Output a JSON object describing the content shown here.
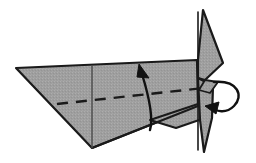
{
  "figure": {
    "step_label": "",
    "background_color": "#ffffff",
    "paper_fill": "#9e9e9e",
    "paper_fill_light": "#a8a8a8",
    "paper_fill_dark": "#8f8f8f",
    "outline_color": "#1a1a1a",
    "crease_color": "#1a1a1a",
    "arrow_color": "#111111"
  },
  "shapes": {
    "wing": {
      "name": "main-wing-panel",
      "fill": "#9e9e9e",
      "stroke": "#1a1a1a",
      "stroke_width": 2.2,
      "points": "16,68 197,60 198,106 92,148"
    },
    "wing_lower_flap": {
      "name": "lower-body-flap",
      "fill": "#9e9e9e",
      "stroke": "#1a1a1a",
      "stroke_width": 2.0,
      "points": "150,120 198,104 205,118 176,128"
    },
    "fin_upper": {
      "name": "vertical-fin-upper",
      "fill": "#9e9e9e",
      "stroke": "#1a1a1a",
      "stroke_width": 2.2,
      "points": "203,10 223,63 205,80 198,78 198,60"
    },
    "fin_lower": {
      "name": "vertical-fin-lower",
      "fill": "#9e9e9e",
      "stroke": "#1a1a1a",
      "stroke_width": 2.2,
      "points": "198,78 213,86 212,118 204,152 200,120"
    },
    "fin_notch": {
      "name": "fin-notch-wedge",
      "fill": "#9e9e9e",
      "stroke": "#1a1a1a",
      "stroke_width": 1.8,
      "points": "205,80 218,82 210,93 199,90"
    }
  },
  "creases": {
    "center_crease": {
      "name": "vertical-center-crease",
      "d": "M 92,66 L 92,148",
      "stroke": "#4a4a4a",
      "stroke_width": 1.4,
      "dash": ""
    },
    "valley_fold": {
      "name": "valley-fold-dashed-line",
      "d": "M 57,104 L 204,88",
      "stroke": "#1a1a1a",
      "stroke_width": 2.4,
      "dash": "11 8"
    },
    "fin_seam": {
      "name": "fin-seam-line",
      "d": "M 198,12 L 198,150",
      "stroke": "#1a1a1a",
      "stroke_width": 1.6,
      "dash": ""
    },
    "body_edge": {
      "name": "body-lower-edge",
      "d": "M 92,148 L 198,106",
      "stroke": "#1a1a1a",
      "stroke_width": 2.0,
      "dash": ""
    }
  },
  "arrows": {
    "fold_up": {
      "name": "fold-up-arrow",
      "label": "fold wing up",
      "path_d": "M 150,130 C 153,120 150,100 142,74",
      "head_points": "139,64 149,78 137,77",
      "stroke": "#111111",
      "stroke_width": 2.4
    },
    "fin_loop": {
      "name": "fin-fold-loop-arrow",
      "label": "fold fin over",
      "path_d": "M 214,82 C 238,80 244,96 234,106 C 226,114 216,112 210,106",
      "head_points": "205,106 219,102 216,114",
      "stroke": "#111111",
      "stroke_width": 2.4
    }
  },
  "annotations": {
    "items": []
  }
}
